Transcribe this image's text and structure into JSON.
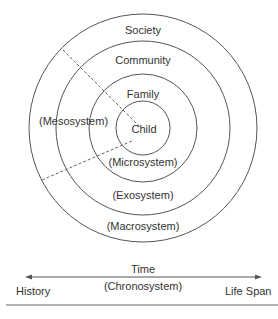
{
  "diagram": {
    "circles": [
      {
        "name": "Society",
        "system": "(Macrosystem)"
      },
      {
        "name": "Community",
        "system": "(Exosystem)"
      },
      {
        "name": "Family",
        "system": "(Microsystem)"
      },
      {
        "name": "Child"
      }
    ],
    "labels": {
      "society": "Society",
      "community": "Community",
      "family": "Family",
      "child": "Child",
      "mesosystem": "(Mesosystem)",
      "microsystem": "(Microsystem)",
      "exosystem": "(Exosystem)",
      "macrosystem": "(Macrosystem)"
    },
    "timeline": {
      "title": "Time",
      "subtitle": "(Chronosystem)",
      "left": "History",
      "right": "Life Span"
    },
    "colors": {
      "line": "#555555",
      "text": "#333333"
    }
  }
}
